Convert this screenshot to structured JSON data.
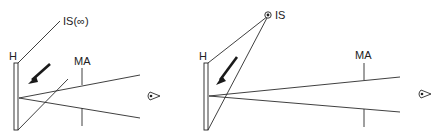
{
  "figures": [
    {
      "id": "left",
      "labels": {
        "hologram": "H",
        "source": "IS(∞)",
        "aperture": "MA"
      },
      "icons": [
        "eye-icon",
        "illumination-arrow-icon"
      ]
    },
    {
      "id": "right",
      "labels": {
        "hologram": "H",
        "source": "IS",
        "aperture": "MA"
      },
      "icons": [
        "eye-icon",
        "illumination-arrow-icon",
        "point-source-icon"
      ]
    }
  ]
}
